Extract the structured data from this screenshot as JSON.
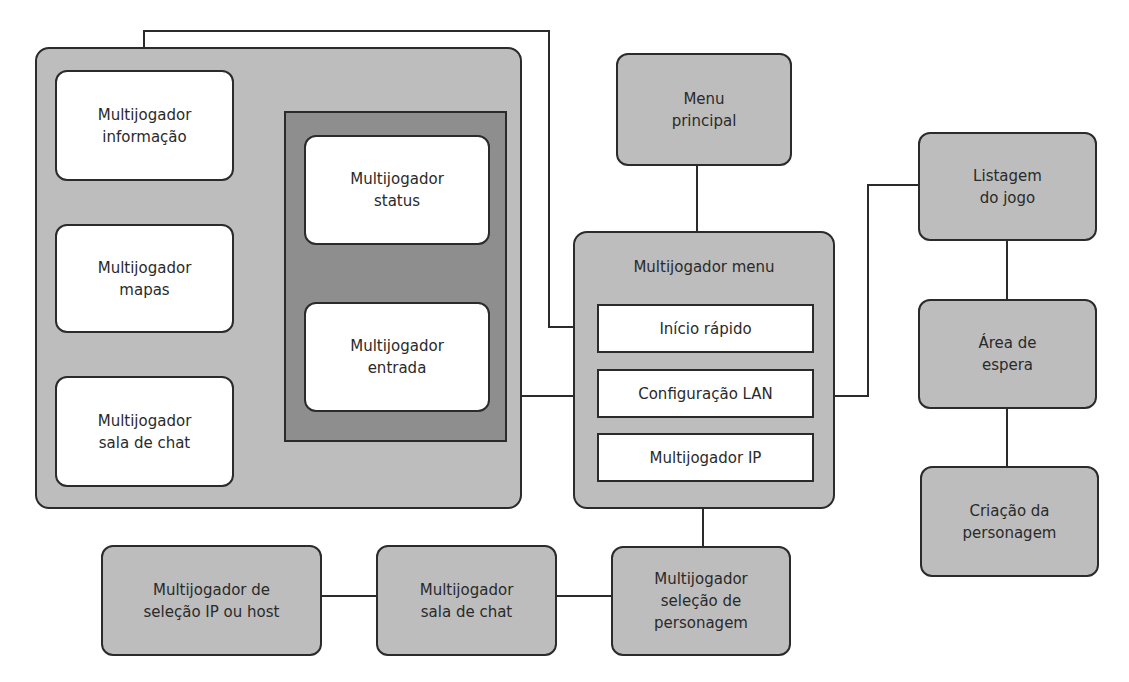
{
  "diagram": {
    "colors": {
      "background": "#ffffff",
      "node_fill": "#bdbdbd",
      "inner_frame_fill": "#8e8e8e",
      "white_node_fill": "#ffffff",
      "stroke": "#2b2b2b"
    },
    "group_left": {
      "nodes": {
        "info": "Multijogador\ninformação",
        "mapas": "Multijogador\nmapas",
        "sala_chat": "Multijogador\nsala de chat"
      },
      "inner_group": {
        "status": "Multijogador\nstatus",
        "entrada": "Multijogador\nentrada"
      }
    },
    "menu_principal": "Menu\nprincipal",
    "multijogador_menu": {
      "title": "Multijogador menu",
      "items": [
        "Início rápido",
        "Configuração LAN",
        "Multijogador IP"
      ]
    },
    "right_column": {
      "listagem": "Listagem\ndo jogo",
      "area_espera": "Área de\nespera",
      "criacao": "Criação da\npersonagem"
    },
    "bottom_row": {
      "selecao_ip": "Multijogador de\nseleção IP ou host",
      "sala_chat": "Multijogador\nsala de chat",
      "selecao_personagem": "Multijogador\nseleção de\npersonagem"
    }
  }
}
